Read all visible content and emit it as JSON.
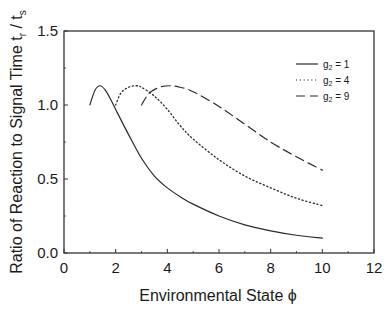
{
  "chart_data": {
    "type": "line",
    "title": "",
    "xlabel": "Environmental State ϕ",
    "ylabel": "Ratio of Reaction to Signal Time t_r / t_s",
    "ylabel_parts": {
      "main": "Ratio of Reaction to Signal Time t",
      "sub1": "r",
      "mid": " / t",
      "sub2": "s"
    },
    "xlim": [
      0,
      12
    ],
    "ylim": [
      0.0,
      1.5
    ],
    "xticks": [
      0,
      2,
      4,
      6,
      8,
      10,
      12
    ],
    "xtick_labels": [
      "0",
      "2",
      "4",
      "6",
      "8",
      "10",
      "12"
    ],
    "yticks": [
      0.0,
      0.5,
      1.0,
      1.5
    ],
    "ytick_labels": [
      "0.0",
      "0.5",
      "1.0",
      "1.5"
    ],
    "grid": false,
    "legend_position": "upper right",
    "series": [
      {
        "name": "g2 = 1",
        "label_main": "g",
        "label_sub": "2",
        "label_rest": " = 1",
        "style": "solid",
        "x": [
          1.0,
          1.2,
          1.4,
          1.6,
          1.8,
          2.0,
          2.5,
          3.0,
          3.5,
          4.0,
          4.5,
          5.0,
          6.0,
          7.0,
          8.0,
          9.0,
          10.0
        ],
        "y": [
          1.0,
          1.1,
          1.13,
          1.1,
          1.04,
          0.97,
          0.8,
          0.64,
          0.52,
          0.44,
          0.38,
          0.33,
          0.25,
          0.19,
          0.15,
          0.12,
          0.1
        ]
      },
      {
        "name": "g2 = 4",
        "label_main": "g",
        "label_sub": "2",
        "label_rest": " = 4",
        "style": "dotted",
        "x": [
          2.0,
          2.2,
          2.5,
          2.8,
          3.0,
          3.5,
          4.0,
          4.5,
          5.0,
          6.0,
          7.0,
          8.0,
          9.0,
          10.0
        ],
        "y": [
          1.0,
          1.08,
          1.12,
          1.13,
          1.12,
          1.06,
          0.97,
          0.86,
          0.77,
          0.63,
          0.52,
          0.44,
          0.37,
          0.32
        ]
      },
      {
        "name": "g2 = 9",
        "label_main": "g",
        "label_sub": "2",
        "label_rest": " = 9",
        "style": "dashed",
        "x": [
          3.0,
          3.3,
          3.7,
          4.1,
          4.5,
          5.0,
          6.0,
          7.0,
          8.0,
          9.0,
          10.0
        ],
        "y": [
          1.0,
          1.08,
          1.12,
          1.13,
          1.12,
          1.09,
          0.99,
          0.87,
          0.75,
          0.65,
          0.56
        ]
      }
    ]
  },
  "colors": {
    "line": "#2a2a2a",
    "axis": "#333333",
    "background": "#ffffff"
  }
}
